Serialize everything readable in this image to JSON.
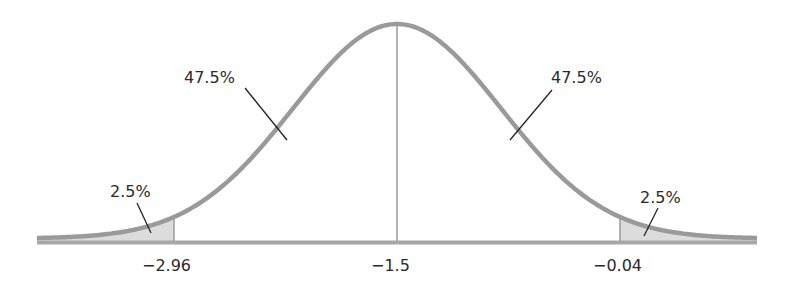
{
  "chart_data": {
    "type": "area",
    "title": "",
    "xlabel": "",
    "ylabel": "",
    "distribution": "normal",
    "mean": -1.5,
    "tick_labels": [
      "−2.96",
      "−1.5",
      "−0.04"
    ],
    "ticks": [
      -2.96,
      -1.5,
      -0.04
    ],
    "regions": [
      {
        "name": "left-tail",
        "from": null,
        "to": -2.96,
        "percent": "2.5%",
        "shaded": true
      },
      {
        "name": "left-center",
        "from": -2.96,
        "to": -1.5,
        "percent": "47.5%",
        "shaded": false
      },
      {
        "name": "right-center",
        "from": -1.5,
        "to": -0.04,
        "percent": "47.5%",
        "shaded": false
      },
      {
        "name": "right-tail",
        "from": -0.04,
        "to": null,
        "percent": "2.5%",
        "shaded": true
      }
    ],
    "grid": false,
    "legend": null
  },
  "labels": {
    "left_tail": "2.5%",
    "left_center": "47.5%",
    "right_center": "47.5%",
    "right_tail": "2.5%",
    "tick_left": "−2.96",
    "tick_center": "−1.5",
    "tick_right": "−0.04"
  },
  "colors": {
    "curve": "#9a9a9a",
    "baseline": "#a8a8a8",
    "shade": "#dcdcdc",
    "leader": "#222222",
    "text": "#2a2a2a"
  }
}
